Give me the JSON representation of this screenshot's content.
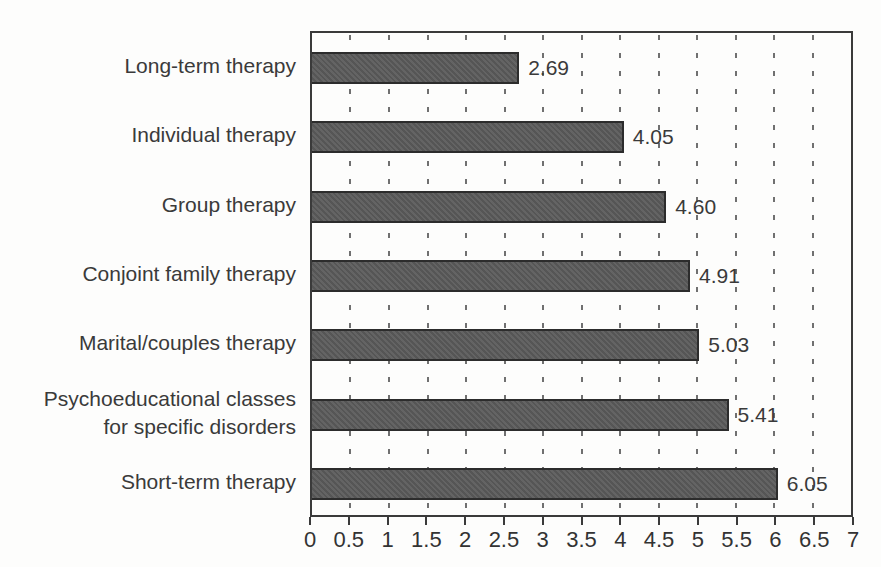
{
  "chart_data": {
    "type": "bar",
    "orientation": "horizontal",
    "title": "",
    "xlabel": "",
    "ylabel": "",
    "legend": "none",
    "grid": "dashed-vertical",
    "categories": [
      "Long-term therapy",
      "Individual therapy",
      "Group therapy",
      "Conjoint family therapy",
      "Marital/couples therapy",
      "Psychoeducational classes\nfor specific disorders",
      "Short-term therapy"
    ],
    "values": [
      2.69,
      4.05,
      4.6,
      4.91,
      5.03,
      5.41,
      6.05
    ],
    "value_labels": [
      "2.69",
      "4.05",
      "4.60",
      "4.91",
      "5.03",
      "5.41",
      "6.05"
    ],
    "xlim": [
      0,
      7
    ],
    "x_ticks": [
      0,
      0.5,
      1,
      1.5,
      2,
      2.5,
      3,
      3.5,
      4,
      4.5,
      5,
      5.5,
      6,
      6.5,
      7
    ],
    "x_tick_labels": [
      "0",
      "0.5",
      "1",
      "1.5",
      "2",
      "2.5",
      "3",
      "3.5",
      "4",
      "4.5",
      "5",
      "5.5",
      "6",
      "6.5",
      "7"
    ],
    "gridline_positions": [
      0.5,
      1,
      1.5,
      2,
      2.5,
      3,
      3.5,
      4,
      4.5,
      5,
      5.5,
      6,
      6.5
    ],
    "colors": {
      "bar_fill": "#5a5a5a",
      "bar_border": "#2c2c2c",
      "axis": "#3a3a3a",
      "grid": "#707070",
      "text": "#3a3a3a",
      "background": "#fdfdfc"
    }
  }
}
